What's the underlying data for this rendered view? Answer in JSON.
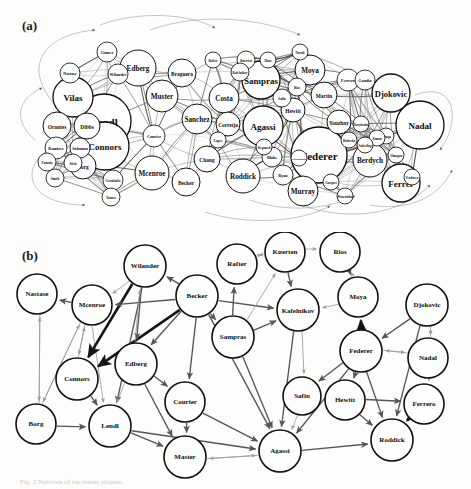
{
  "figure": {
    "panel_a_label": "(a)",
    "panel_b_label": "(b)",
    "caption": "Fig. 2  Network of top tennis players."
  },
  "chart_data": {
    "type": "diagram",
    "subtitle": "(a) full weighted network with node size by prestige; (b) reduced network of top players",
    "panels": [
      {
        "id": "a",
        "label": "(a)",
        "description": "Dense circle-packed network of tennis players; circle radius encodes player prestige/ranking score.",
        "nodes": [
          {
            "name": "Lendl",
            "x": 104,
            "y": 121,
            "r": 27
          },
          {
            "name": "Federer",
            "x": 319,
            "y": 155,
            "r": 28
          },
          {
            "name": "Connors",
            "x": 105,
            "y": 146,
            "r": 24
          },
          {
            "name": "Nadal",
            "x": 420,
            "y": 125,
            "r": 24
          },
          {
            "name": "Vilas",
            "x": 73,
            "y": 97,
            "r": 20
          },
          {
            "name": "Agassi",
            "x": 263,
            "y": 126,
            "r": 20
          },
          {
            "name": "Sampras",
            "x": 261,
            "y": 80,
            "r": 19
          },
          {
            "name": "Djokovic",
            "x": 391,
            "y": 93,
            "r": 19
          },
          {
            "name": "Ferrer",
            "x": 401,
            "y": 183,
            "r": 19
          },
          {
            "name": "Edberg",
            "x": 138,
            "y": 68,
            "r": 18
          },
          {
            "name": "Mcenroe",
            "x": 152,
            "y": 173,
            "r": 17
          },
          {
            "name": "Berdych",
            "x": 370,
            "y": 160,
            "r": 17
          },
          {
            "name": "Muster",
            "x": 162,
            "y": 96,
            "r": 16
          },
          {
            "name": "Roddick",
            "x": 243,
            "y": 176,
            "r": 17
          },
          {
            "name": "Costa",
            "x": 224,
            "y": 98,
            "r": 15
          },
          {
            "name": "Sanchez",
            "x": 197,
            "y": 119,
            "r": 15
          },
          {
            "name": "Murray",
            "x": 303,
            "y": 191,
            "r": 15
          },
          {
            "name": "Moya",
            "x": 310,
            "y": 70,
            "r": 15
          },
          {
            "name": "Becker",
            "x": 186,
            "y": 182,
            "r": 14
          },
          {
            "name": "Orantes",
            "x": 57,
            "y": 126,
            "r": 14
          },
          {
            "name": "Braguera",
            "x": 182,
            "y": 73,
            "r": 14
          },
          {
            "name": "Chang",
            "x": 207,
            "y": 159,
            "r": 13
          },
          {
            "name": "Dibbs",
            "x": 87,
            "y": 126,
            "r": 13
          },
          {
            "name": "Borg",
            "x": 83,
            "y": 166,
            "r": 13
          },
          {
            "name": "Martin",
            "x": 324,
            "y": 95,
            "r": 13
          },
          {
            "name": "Corretja",
            "x": 228,
            "y": 124,
            "r": 12
          },
          {
            "name": "Hewitt",
            "x": 293,
            "y": 110,
            "r": 12
          },
          {
            "name": "Youzhny",
            "x": 339,
            "y": 122,
            "r": 12
          },
          {
            "name": "Ferrero",
            "x": 348,
            "y": 80,
            "r": 11
          },
          {
            "name": "Courier",
            "x": 154,
            "y": 136,
            "r": 11
          },
          {
            "name": "Ramirez",
            "x": 56,
            "y": 148,
            "r": 11
          },
          {
            "name": "Solomon",
            "x": 80,
            "y": 148,
            "r": 10
          },
          {
            "name": "Blake",
            "x": 272,
            "y": 157,
            "r": 10
          },
          {
            "name": "Ryan",
            "x": 283,
            "y": 175,
            "r": 10
          },
          {
            "name": "Gaudio",
            "x": 365,
            "y": 80,
            "r": 10
          },
          {
            "name": "Nastase",
            "x": 70,
            "y": 73,
            "r": 10
          },
          {
            "name": "Wilander",
            "x": 118,
            "y": 74,
            "r": 10
          },
          {
            "name": "Gomez",
            "x": 107,
            "y": 52,
            "r": 10
          },
          {
            "name": "Gerulaitis",
            "x": 113,
            "y": 180,
            "r": 10
          },
          {
            "name": "Smith",
            "x": 55,
            "y": 178,
            "r": 9
          },
          {
            "name": "Panatta",
            "x": 47,
            "y": 162,
            "r": 9
          },
          {
            "name": "Tanner",
            "x": 111,
            "y": 197,
            "r": 9
          },
          {
            "name": "Stich",
            "x": 73,
            "y": 163,
            "r": 9
          },
          {
            "name": "Safin",
            "x": 282,
            "y": 98,
            "r": 9
          },
          {
            "name": "Rios",
            "x": 297,
            "y": 87,
            "r": 9
          },
          {
            "name": "Kuerten",
            "x": 246,
            "y": 60,
            "r": 9
          },
          {
            "name": "Kafelnikov",
            "x": 240,
            "y": 72,
            "r": 9
          },
          {
            "name": "Rafter",
            "x": 213,
            "y": 60,
            "r": 8
          },
          {
            "name": "Haas",
            "x": 268,
            "y": 60,
            "r": 8
          },
          {
            "name": "Novak",
            "x": 300,
            "y": 52,
            "r": 8
          },
          {
            "name": "Tsonga",
            "x": 386,
            "y": 136,
            "r": 8
          },
          {
            "name": "Simon",
            "x": 377,
            "y": 138,
            "r": 8
          },
          {
            "name": "Almagro",
            "x": 396,
            "y": 155,
            "r": 8
          },
          {
            "name": "Verdasco",
            "x": 412,
            "y": 177,
            "r": 8
          },
          {
            "name": "Robredo",
            "x": 349,
            "y": 140,
            "r": 8
          },
          {
            "name": "Gasquet",
            "x": 331,
            "y": 182,
            "r": 8
          },
          {
            "name": "Wawrinka",
            "x": 345,
            "y": 196,
            "r": 8
          },
          {
            "name": "Soderling",
            "x": 365,
            "y": 145,
            "r": 8
          },
          {
            "name": "Davydenko",
            "x": 361,
            "y": 124,
            "r": 8
          },
          {
            "name": "Nalbandian",
            "x": 299,
            "y": 158,
            "r": 8
          },
          {
            "name": "Lopez",
            "x": 218,
            "y": 140,
            "r": 8
          },
          {
            "name": "Stepanek",
            "x": 264,
            "y": 147,
            "r": 8
          }
        ]
      },
      {
        "id": "b",
        "label": "(b)",
        "description": "Reduced directed network of 25 top players; arrow darkness/thickness encodes win dominance.",
        "nodes": [
          {
            "name": "Nastase",
            "x": 37,
            "y": 294,
            "r": 20
          },
          {
            "name": "Mcenroe",
            "x": 92,
            "y": 305,
            "r": 20
          },
          {
            "name": "Wilander",
            "x": 145,
            "y": 266,
            "r": 21
          },
          {
            "name": "Becker",
            "x": 197,
            "y": 296,
            "r": 21
          },
          {
            "name": "Rafter",
            "x": 237,
            "y": 264,
            "r": 20
          },
          {
            "name": "Kuerten",
            "x": 285,
            "y": 252,
            "r": 20
          },
          {
            "name": "Rios",
            "x": 340,
            "y": 252,
            "r": 20
          },
          {
            "name": "Moya",
            "x": 358,
            "y": 297,
            "r": 20
          },
          {
            "name": "Djokovic",
            "x": 427,
            "y": 305,
            "r": 21
          },
          {
            "name": "Kafelnikov",
            "x": 298,
            "y": 310,
            "r": 21
          },
          {
            "name": "Sampras",
            "x": 233,
            "y": 337,
            "r": 21
          },
          {
            "name": "Federer",
            "x": 361,
            "y": 351,
            "r": 21
          },
          {
            "name": "Nadal",
            "x": 428,
            "y": 358,
            "r": 20
          },
          {
            "name": "Connors",
            "x": 77,
            "y": 379,
            "r": 21
          },
          {
            "name": "Edberg",
            "x": 136,
            "y": 364,
            "r": 21
          },
          {
            "name": "Courier",
            "x": 185,
            "y": 402,
            "r": 20
          },
          {
            "name": "Safin",
            "x": 302,
            "y": 396,
            "r": 19
          },
          {
            "name": "Hewitt",
            "x": 345,
            "y": 400,
            "r": 20
          },
          {
            "name": "Ferrero",
            "x": 424,
            "y": 404,
            "r": 20
          },
          {
            "name": "Borg",
            "x": 36,
            "y": 424,
            "r": 20
          },
          {
            "name": "Lendl",
            "x": 110,
            "y": 426,
            "r": 21
          },
          {
            "name": "Master",
            "x": 185,
            "y": 457,
            "r": 21
          },
          {
            "name": "Agassi",
            "x": 280,
            "y": 451,
            "r": 21
          },
          {
            "name": "Roddick",
            "x": 392,
            "y": 440,
            "r": 21
          }
        ],
        "edges": [
          {
            "from": "Nastase",
            "to": "Borg",
            "weight": "light"
          },
          {
            "from": "Borg",
            "to": "Nastase",
            "weight": "light"
          },
          {
            "from": "Mcenroe",
            "to": "Nastase",
            "weight": "mid"
          },
          {
            "from": "Mcenroe",
            "to": "Connors",
            "weight": "light"
          },
          {
            "from": "Connors",
            "to": "Mcenroe",
            "weight": "light"
          },
          {
            "from": "Mcenroe",
            "to": "Borg",
            "weight": "light"
          },
          {
            "from": "Borg",
            "to": "Mcenroe",
            "weight": "light"
          },
          {
            "from": "Mcenroe",
            "to": "Lendl",
            "weight": "light"
          },
          {
            "from": "Wilander",
            "to": "Mcenroe",
            "weight": "light"
          },
          {
            "from": "Wilander",
            "to": "Connors",
            "weight": "dark"
          },
          {
            "from": "Becker",
            "to": "Connors",
            "weight": "dark"
          },
          {
            "from": "Becker",
            "to": "Wilander",
            "weight": "mid"
          },
          {
            "from": "Becker",
            "to": "Mcenroe",
            "weight": "mid"
          },
          {
            "from": "Becker",
            "to": "Edberg",
            "weight": "mid"
          },
          {
            "from": "Becker",
            "to": "Courier",
            "weight": "mid"
          },
          {
            "from": "Becker",
            "to": "Sampras",
            "weight": "mid"
          },
          {
            "from": "Becker",
            "to": "Agassi",
            "weight": "mid"
          },
          {
            "from": "Becker",
            "to": "Kafelnikov",
            "weight": "mid"
          },
          {
            "from": "Wilander",
            "to": "Lendl",
            "weight": "mid"
          },
          {
            "from": "Wilander",
            "to": "Edberg",
            "weight": "mid"
          },
          {
            "from": "Edberg",
            "to": "Wilander",
            "weight": "light"
          },
          {
            "from": "Edberg",
            "to": "Lendl",
            "weight": "light"
          },
          {
            "from": "Edberg",
            "to": "Courier",
            "weight": "mid"
          },
          {
            "from": "Edberg",
            "to": "Master",
            "weight": "mid"
          },
          {
            "from": "Connors",
            "to": "Lendl",
            "weight": "mid"
          },
          {
            "from": "Borg",
            "to": "Lendl",
            "weight": "mid"
          },
          {
            "from": "Lendl",
            "to": "Master",
            "weight": "mid"
          },
          {
            "from": "Lendl",
            "to": "Agassi",
            "weight": "mid"
          },
          {
            "from": "Courier",
            "to": "Master",
            "weight": "mid"
          },
          {
            "from": "Courier",
            "to": "Agassi",
            "weight": "mid"
          },
          {
            "from": "Sampras",
            "to": "Agassi",
            "weight": "mid"
          },
          {
            "from": "Sampras",
            "to": "Kafelnikov",
            "weight": "mid"
          },
          {
            "from": "Sampras",
            "to": "Rafter",
            "weight": "mid"
          },
          {
            "from": "Sampras",
            "to": "Kuerten",
            "weight": "light"
          },
          {
            "from": "Rafter",
            "to": "Kuerten",
            "weight": "light"
          },
          {
            "from": "Kuerten",
            "to": "Rafter",
            "weight": "light"
          },
          {
            "from": "Kuerten",
            "to": "Rios",
            "weight": "light"
          },
          {
            "from": "Kuerten",
            "to": "Kafelnikov",
            "weight": "mid"
          },
          {
            "from": "Rios",
            "to": "Moya",
            "weight": "mid"
          },
          {
            "from": "Moya",
            "to": "Rios",
            "weight": "light"
          },
          {
            "from": "Moya",
            "to": "Kafelnikov",
            "weight": "light"
          },
          {
            "from": "Kafelnikov",
            "to": "Agassi",
            "weight": "mid"
          },
          {
            "from": "Kafelnikov",
            "to": "Safin",
            "weight": "light"
          },
          {
            "from": "Federer",
            "to": "Moya",
            "weight": "dark"
          },
          {
            "from": "Federer",
            "to": "Hewitt",
            "weight": "mid"
          },
          {
            "from": "Federer",
            "to": "Roddick",
            "weight": "mid"
          },
          {
            "from": "Federer",
            "to": "Agassi",
            "weight": "mid"
          },
          {
            "from": "Federer",
            "to": "Safin",
            "weight": "mid"
          },
          {
            "from": "Federer",
            "to": "Nadal",
            "weight": "light"
          },
          {
            "from": "Nadal",
            "to": "Federer",
            "weight": "light"
          },
          {
            "from": "Djokovic",
            "to": "Nadal",
            "weight": "light"
          },
          {
            "from": "Nadal",
            "to": "Djokovic",
            "weight": "light"
          },
          {
            "from": "Djokovic",
            "to": "Federer",
            "weight": "mid"
          },
          {
            "from": "Djokovic",
            "to": "Roddick",
            "weight": "mid"
          },
          {
            "from": "Nadal",
            "to": "Ferrero",
            "weight": "light"
          },
          {
            "from": "Ferrero",
            "to": "Roddick",
            "weight": "dark"
          },
          {
            "from": "Hewitt",
            "to": "Ferrero",
            "weight": "mid"
          },
          {
            "from": "Hewitt",
            "to": "Roddick",
            "weight": "mid"
          },
          {
            "from": "Safin",
            "to": "Agassi",
            "weight": "light"
          },
          {
            "from": "Agassi",
            "to": "Roddick",
            "weight": "mid"
          },
          {
            "from": "Agassi",
            "to": "Master",
            "weight": "light"
          },
          {
            "from": "Master",
            "to": "Agassi",
            "weight": "light"
          }
        ]
      }
    ]
  }
}
